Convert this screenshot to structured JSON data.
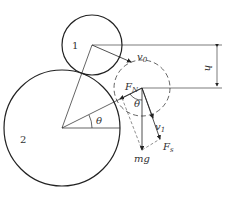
{
  "diagram": {
    "circles": [
      {
        "id": "1",
        "label": "1",
        "style": "solid"
      },
      {
        "id": "2",
        "label": "2",
        "style": "solid"
      },
      {
        "id": "1-later",
        "label": "",
        "style": "dashed"
      }
    ],
    "labels": {
      "circle1": "1",
      "circle2": "2",
      "v0": "v",
      "v0_sub": "0",
      "v1": "v",
      "v1_sub": "1",
      "FN": "F",
      "FN_sub": "N",
      "Fs": "F",
      "Fs_sub": "s",
      "mg": "mg",
      "theta_center": "θ",
      "theta_force": "θ",
      "h": "h"
    }
  }
}
